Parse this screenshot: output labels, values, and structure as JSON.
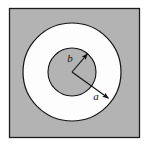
{
  "figure": {
    "labels": {
      "inner_radius": "b",
      "outer_radius": "a"
    },
    "colors": {
      "plate_fill": "#b3b3b3",
      "annulus_fill": "#fefefe",
      "inner_disk_fill": "#b3b3b3",
      "stroke": "#1a1a1a",
      "page_background": "#ffffff"
    },
    "geometry": {
      "square": {
        "x": 9,
        "y": 8,
        "width": 131,
        "height": 130
      },
      "center": {
        "x": 72,
        "y": 72
      },
      "outer_radius": 49,
      "inner_radius": 24,
      "arrow_b": {
        "from": {
          "x": 72,
          "y": 72
        },
        "to": {
          "x": 89,
          "y": 52
        }
      },
      "arrow_a": {
        "from": {
          "x": 72,
          "y": 72
        },
        "to": {
          "x": 111,
          "y": 100
        }
      },
      "label_b_pos": {
        "x": 71,
        "y": 61
      },
      "label_a_pos": {
        "x": 95,
        "y": 98
      }
    }
  }
}
